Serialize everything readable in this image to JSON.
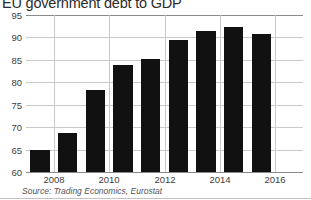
{
  "chart_data": {
    "type": "bar",
    "title": "EU government debt to GDP",
    "subtitle": "",
    "xlabel": "",
    "ylabel": "",
    "source": "Source: Trading Economics, Eurostat",
    "categories": [
      "2007",
      "2008",
      "2009",
      "2010",
      "2011",
      "2012",
      "2013",
      "2014",
      "2015"
    ],
    "values": [
      64.9,
      68.7,
      78.3,
      83.9,
      85.2,
      89.4,
      91.4,
      92.3,
      90.8
    ],
    "series": [
      {
        "name": "EU government debt to GDP",
        "values": [
          64.9,
          68.7,
          78.3,
          83.9,
          85.2,
          89.4,
          91.4,
          92.3,
          90.8
        ]
      }
    ],
    "ylim": [
      60,
      95
    ],
    "yticks": [
      60,
      65,
      70,
      75,
      80,
      85,
      90,
      95
    ],
    "ytick_labels": [
      "60",
      "65",
      "70",
      "75",
      "80",
      "85",
      "90",
      "95"
    ],
    "xtick_labels": [
      "2008",
      "2010",
      "2012",
      "2014",
      "2016"
    ],
    "xtick_positions": [
      1,
      3,
      5,
      7,
      9
    ],
    "grid": "horizontal-and-vertical",
    "legend": "none",
    "bar_color": "#111111",
    "grid_color": "#c9c9c9",
    "axis_color": "#8a8a8a",
    "text_color": "#3c3c3c"
  }
}
